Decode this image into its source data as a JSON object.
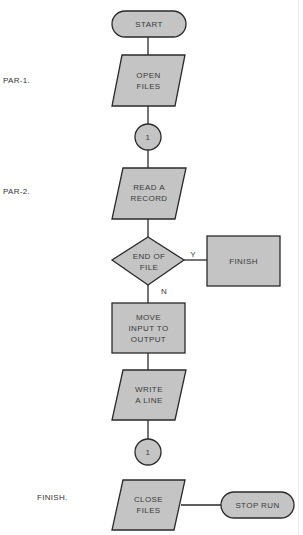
{
  "paragraph_labels": {
    "par1": "PAR-1.",
    "par2": "PAR-2.",
    "finish": "FINISH."
  },
  "nodes": {
    "start": {
      "type": "terminal",
      "label": "START"
    },
    "open_files": {
      "type": "io",
      "line1": "OPEN",
      "line2": "FILES"
    },
    "connector_top": {
      "type": "connector",
      "label": "1"
    },
    "read_record": {
      "type": "io",
      "line1": "READ A",
      "line2": "RECORD"
    },
    "end_of_file": {
      "type": "decision",
      "line1": "END OF",
      "line2": "FILE"
    },
    "finish": {
      "type": "process",
      "label": "FINISH"
    },
    "move_input": {
      "type": "process",
      "line1": "MOVE",
      "line2": "INPUT TO",
      "line3": "OUTPUT"
    },
    "write_line": {
      "type": "io",
      "line1": "WRITE",
      "line2": "A LINE"
    },
    "connector_bottom": {
      "type": "connector",
      "label": "1"
    },
    "close_files": {
      "type": "io",
      "line1": "CLOSE",
      "line2": "FILES"
    },
    "stop_run": {
      "type": "terminal",
      "label": "STOP RUN"
    }
  },
  "edges": {
    "yes_label": "Y",
    "no_label": "N"
  },
  "colors": {
    "shape_fill": "#c4c4c4",
    "stroke": "#2a2a2a",
    "text": "#3a3a3a"
  }
}
